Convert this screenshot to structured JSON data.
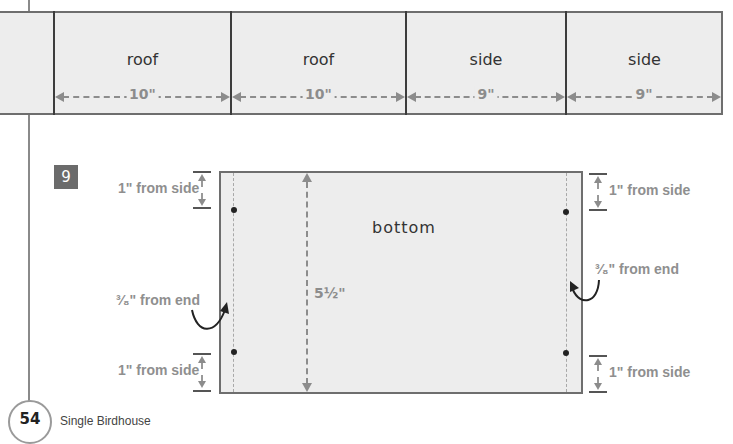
{
  "page": {
    "number": "54",
    "title": "Single Birdhouse",
    "step_number": "9"
  },
  "board_strip": {
    "parts": [
      {
        "label": "roof",
        "dimension": "10\""
      },
      {
        "label": "roof",
        "dimension": "10\""
      },
      {
        "label": "side",
        "dimension": "9\""
      },
      {
        "label": "side",
        "dimension": "9\""
      }
    ]
  },
  "bottom_diagram": {
    "label": "bottom",
    "width_dimension": "5½\"",
    "notes": {
      "left_top": "1\" from side",
      "left_middle": "³⁄₈\" from end",
      "left_bottom": "1\" from side",
      "right_top": "1\" from side",
      "right_middle": "³⁄₈\" from end",
      "right_bottom": "1\" from side"
    }
  },
  "colors": {
    "board_fill": "#ededed",
    "board_border": "#6e6e6e",
    "dimension_gray": "#8c8c8c",
    "badge": "#6b6b6b"
  }
}
